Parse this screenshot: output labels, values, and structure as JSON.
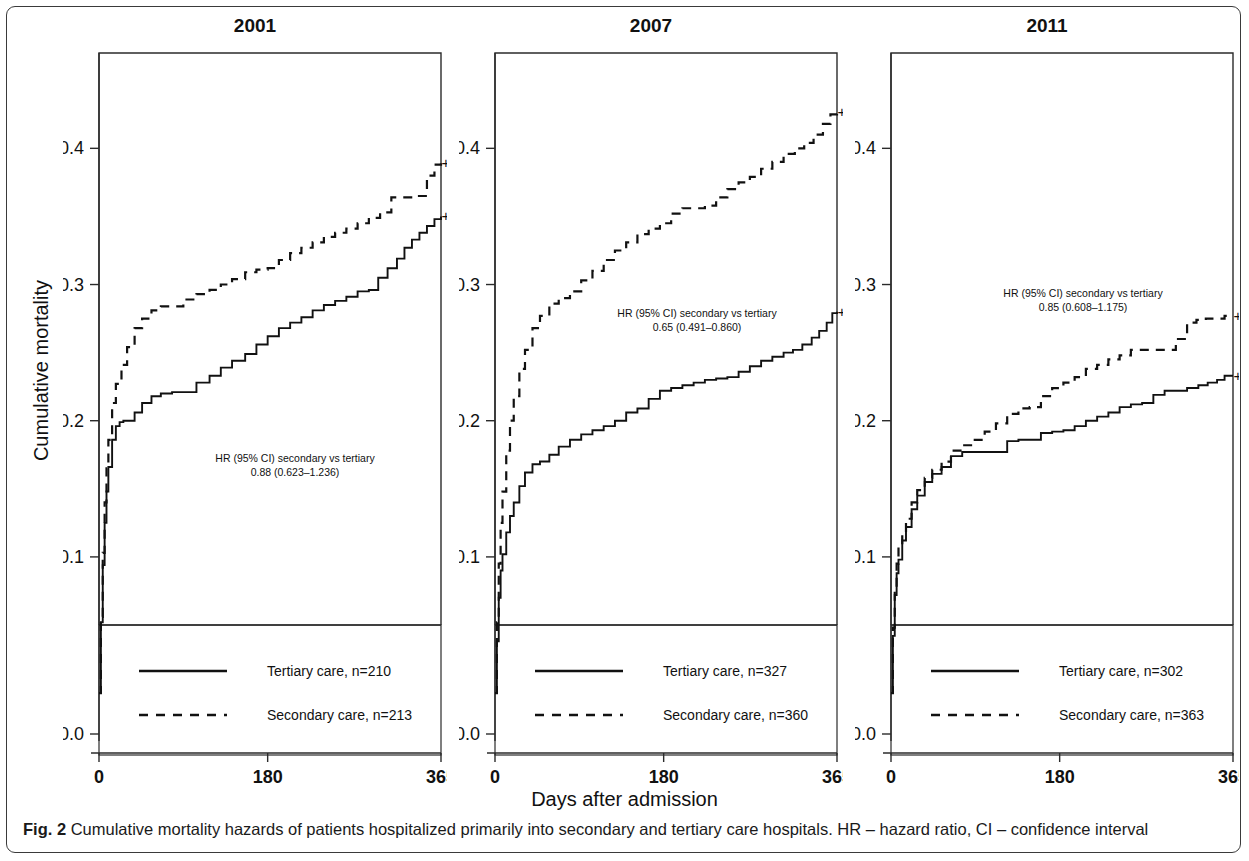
{
  "figure": {
    "caption_prefix": "Fig. 2",
    "caption_text": "Cumulative mortality hazards of patients hospitalized primarily into secondary and tertiary care hospitals. HR – hazard ratio, CI – confidence interval",
    "x_axis_label": "Days after admission",
    "y_axis_label": "Cumulative mortality"
  },
  "chart_data": [
    {
      "type": "line",
      "title": "2001",
      "xlabel": "Days after admission",
      "ylabel": "Cumulative mortality",
      "xlim": [
        0,
        365
      ],
      "ylim": [
        0.0,
        0.47
      ],
      "xticks": [
        0,
        180,
        365
      ],
      "yticks": [
        0.0,
        0.1,
        0.2,
        0.3,
        0.4
      ],
      "grid": false,
      "legend_position": "bottom",
      "annotation_line1": "HR (95% CI) secondary vs tertiary",
      "annotation_line2": "0.88 (0.623–1.236)",
      "hr": "0.88",
      "ci_low": "0.623",
      "ci_high": "1.236",
      "series": [
        {
          "name": "Tertiary care, n=210",
          "style": "solid",
          "n": 210,
          "censor_mark": "+",
          "x": [
            0,
            2,
            4,
            6,
            8,
            10,
            14,
            18,
            22,
            26,
            30,
            38,
            46,
            56,
            66,
            78,
            90,
            104,
            118,
            130,
            142,
            156,
            168,
            180,
            192,
            204,
            216,
            228,
            240,
            252,
            264,
            276,
            288,
            298,
            308,
            318,
            326,
            334,
            342,
            350,
            358,
            365
          ],
          "y": [
            0.0,
            0.052,
            0.094,
            0.125,
            0.148,
            0.166,
            0.186,
            0.196,
            0.199,
            0.2,
            0.2,
            0.206,
            0.213,
            0.218,
            0.22,
            0.221,
            0.221,
            0.228,
            0.233,
            0.239,
            0.244,
            0.249,
            0.256,
            0.262,
            0.268,
            0.272,
            0.276,
            0.281,
            0.285,
            0.288,
            0.291,
            0.295,
            0.296,
            0.305,
            0.312,
            0.319,
            0.327,
            0.333,
            0.338,
            0.343,
            0.348,
            0.35
          ]
        },
        {
          "name": "Secondary care, n=213",
          "style": "dashed",
          "n": 213,
          "censor_mark": "+",
          "x": [
            0,
            2,
            4,
            6,
            8,
            10,
            14,
            18,
            24,
            30,
            38,
            46,
            56,
            66,
            78,
            90,
            104,
            118,
            130,
            142,
            156,
            168,
            180,
            192,
            204,
            216,
            228,
            240,
            252,
            264,
            276,
            288,
            300,
            312,
            322,
            330,
            340,
            350,
            358,
            365
          ],
          "y": [
            0.0,
            0.056,
            0.103,
            0.14,
            0.165,
            0.186,
            0.213,
            0.227,
            0.241,
            0.254,
            0.268,
            0.275,
            0.281,
            0.284,
            0.284,
            0.289,
            0.293,
            0.296,
            0.3,
            0.304,
            0.309,
            0.311,
            0.312,
            0.318,
            0.323,
            0.327,
            0.331,
            0.335,
            0.338,
            0.341,
            0.345,
            0.349,
            0.353,
            0.364,
            0.364,
            0.364,
            0.365,
            0.38,
            0.388,
            0.389
          ]
        }
      ]
    },
    {
      "type": "line",
      "title": "2007",
      "xlabel": "Days after admission",
      "ylabel": "Cumulative mortality",
      "xlim": [
        0,
        365
      ],
      "ylim": [
        0.0,
        0.47
      ],
      "xticks": [
        0,
        180,
        365
      ],
      "yticks": [
        0.0,
        0.1,
        0.2,
        0.3,
        0.4
      ],
      "grid": false,
      "legend_position": "bottom",
      "annotation_line1": "HR (95% CI) secondary vs tertiary",
      "annotation_line2": "0.65 (0.491–0.860)",
      "hr": "0.65",
      "ci_low": "0.491",
      "ci_high": "0.860",
      "series": [
        {
          "name": "Tertiary care, n=327",
          "style": "solid",
          "n": 327,
          "censor_mark": "+",
          "x": [
            0,
            2,
            4,
            6,
            8,
            12,
            16,
            20,
            26,
            32,
            40,
            48,
            58,
            68,
            80,
            92,
            104,
            116,
            128,
            140,
            152,
            164,
            176,
            188,
            200,
            212,
            224,
            236,
            248,
            260,
            272,
            284,
            296,
            308,
            318,
            328,
            338,
            346,
            354,
            360,
            365
          ],
          "y": [
            0.0,
            0.038,
            0.07,
            0.09,
            0.102,
            0.118,
            0.13,
            0.14,
            0.152,
            0.162,
            0.168,
            0.17,
            0.175,
            0.181,
            0.186,
            0.19,
            0.193,
            0.196,
            0.2,
            0.206,
            0.209,
            0.216,
            0.222,
            0.224,
            0.226,
            0.228,
            0.23,
            0.231,
            0.232,
            0.236,
            0.24,
            0.244,
            0.247,
            0.25,
            0.252,
            0.256,
            0.261,
            0.266,
            0.272,
            0.279,
            0.28
          ]
        },
        {
          "name": "Secondary care, n=360",
          "style": "dashed",
          "n": 360,
          "censor_mark": "+",
          "x": [
            0,
            2,
            4,
            6,
            8,
            12,
            16,
            20,
            26,
            32,
            40,
            48,
            58,
            68,
            80,
            92,
            104,
            116,
            128,
            140,
            152,
            164,
            176,
            188,
            200,
            212,
            224,
            236,
            248,
            260,
            272,
            284,
            296,
            308,
            320,
            330,
            340,
            350,
            358,
            365
          ],
          "y": [
            0.0,
            0.052,
            0.095,
            0.125,
            0.148,
            0.178,
            0.2,
            0.218,
            0.238,
            0.252,
            0.268,
            0.277,
            0.286,
            0.29,
            0.295,
            0.303,
            0.31,
            0.318,
            0.325,
            0.331,
            0.337,
            0.341,
            0.345,
            0.352,
            0.356,
            0.356,
            0.358,
            0.364,
            0.37,
            0.375,
            0.379,
            0.385,
            0.39,
            0.396,
            0.4,
            0.404,
            0.41,
            0.418,
            0.425,
            0.427
          ]
        }
      ]
    },
    {
      "type": "line",
      "title": "2011",
      "xlabel": "Days after admission",
      "ylabel": "Cumulative mortality",
      "xlim": [
        0,
        365
      ],
      "ylim": [
        0.0,
        0.47
      ],
      "xticks": [
        0,
        180,
        365
      ],
      "yticks": [
        0.0,
        0.1,
        0.2,
        0.3,
        0.4
      ],
      "grid": false,
      "legend_position": "bottom",
      "annotation_line1": "HR (95% CI) secondary vs tertiary",
      "annotation_line2": "0.85 (0.608–1.175)",
      "hr": "0.85",
      "ci_low": "0.608",
      "ci_high": "1.175",
      "series": [
        {
          "name": "Tertiary care, n=302",
          "style": "solid",
          "n": 302,
          "censor_mark": "+",
          "x": [
            0,
            2,
            4,
            6,
            8,
            12,
            16,
            22,
            28,
            36,
            44,
            54,
            64,
            76,
            88,
            100,
            112,
            124,
            136,
            148,
            160,
            172,
            184,
            196,
            208,
            220,
            232,
            244,
            256,
            268,
            280,
            292,
            304,
            316,
            328,
            338,
            348,
            356,
            365
          ],
          "y": [
            0.0,
            0.042,
            0.072,
            0.088,
            0.098,
            0.112,
            0.122,
            0.135,
            0.145,
            0.155,
            0.161,
            0.166,
            0.174,
            0.177,
            0.177,
            0.177,
            0.177,
            0.185,
            0.186,
            0.186,
            0.191,
            0.192,
            0.193,
            0.196,
            0.2,
            0.203,
            0.206,
            0.21,
            0.212,
            0.213,
            0.219,
            0.222,
            0.222,
            0.224,
            0.226,
            0.228,
            0.23,
            0.233,
            0.233
          ]
        },
        {
          "name": "Secondary care, n=363",
          "style": "dashed",
          "n": 363,
          "censor_mark": "+",
          "x": [
            0,
            2,
            4,
            6,
            8,
            12,
            16,
            22,
            28,
            36,
            44,
            54,
            64,
            76,
            88,
            100,
            112,
            124,
            136,
            148,
            160,
            172,
            184,
            196,
            208,
            220,
            232,
            244,
            256,
            268,
            280,
            292,
            304,
            316,
            326,
            336,
            346,
            356,
            365
          ],
          "y": [
            0.0,
            0.048,
            0.078,
            0.095,
            0.107,
            0.118,
            0.128,
            0.14,
            0.149,
            0.158,
            0.164,
            0.17,
            0.178,
            0.182,
            0.186,
            0.192,
            0.198,
            0.205,
            0.209,
            0.21,
            0.218,
            0.224,
            0.228,
            0.232,
            0.238,
            0.241,
            0.245,
            0.248,
            0.252,
            0.252,
            0.252,
            0.252,
            0.26,
            0.272,
            0.274,
            0.275,
            0.275,
            0.277,
            0.277
          ]
        }
      ]
    }
  ]
}
